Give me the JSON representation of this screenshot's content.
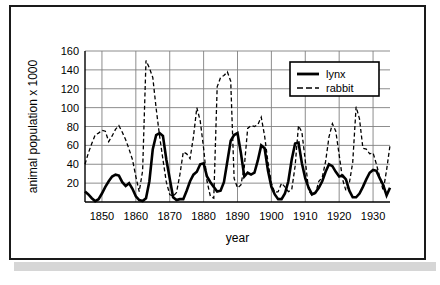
{
  "figure": {
    "border_color": "#1a1a1a",
    "shadow_color": "#d6d6d6",
    "background": "#ffffff"
  },
  "chart_data": {
    "type": "line",
    "title": "",
    "subtitle": "",
    "xlabel": "year",
    "ylabel": "animal population x 1000",
    "xlim": [
      1845,
      1935
    ],
    "ylim": [
      0,
      160
    ],
    "xticks": [
      1850,
      1860,
      1870,
      1880,
      1890,
      1900,
      1910,
      1920,
      1930
    ],
    "yticks": [
      20,
      40,
      60,
      80,
      100,
      120,
      140,
      160
    ],
    "xtick_labels": [
      "1850",
      "1860",
      "1870",
      "1880",
      "1890",
      "1900",
      "1910",
      "1920",
      "1930"
    ],
    "ytick_labels": [
      "20",
      "40",
      "60",
      "80",
      "100",
      "120",
      "140",
      "160"
    ],
    "grid": true,
    "grid_color": "#808080",
    "legend_position": "upper right",
    "legend_entries": [
      "lynx",
      "rabbit"
    ],
    "x": [
      1845,
      1846,
      1847,
      1848,
      1849,
      1850,
      1851,
      1852,
      1853,
      1854,
      1855,
      1856,
      1857,
      1858,
      1859,
      1860,
      1861,
      1862,
      1863,
      1864,
      1865,
      1866,
      1867,
      1868,
      1869,
      1870,
      1871,
      1872,
      1873,
      1874,
      1875,
      1876,
      1877,
      1878,
      1879,
      1880,
      1881,
      1882,
      1883,
      1884,
      1885,
      1886,
      1887,
      1888,
      1889,
      1890,
      1891,
      1892,
      1893,
      1894,
      1895,
      1896,
      1897,
      1898,
      1899,
      1900,
      1901,
      1902,
      1903,
      1904,
      1905,
      1906,
      1907,
      1908,
      1909,
      1910,
      1911,
      1912,
      1913,
      1914,
      1915,
      1916,
      1917,
      1918,
      1919,
      1920,
      1921,
      1922,
      1923,
      1924,
      1925,
      1926,
      1927,
      1928,
      1929,
      1930,
      1931,
      1932,
      1933,
      1934,
      1935
    ],
    "series": [
      {
        "name": "lynx",
        "style": "solid",
        "color": "#000000",
        "line_width": 2.6,
        "values": [
          11,
          8,
          4,
          1,
          3,
          9,
          16,
          22,
          27,
          29,
          28,
          21,
          17,
          20,
          14,
          6,
          2,
          1,
          4,
          22,
          56,
          71,
          73,
          70,
          45,
          25,
          5,
          2,
          3,
          3,
          12,
          22,
          29,
          32,
          40,
          41,
          27,
          21,
          16,
          11,
          12,
          21,
          43,
          65,
          71,
          73,
          52,
          27,
          31,
          29,
          31,
          44,
          60,
          57,
          33,
          16,
          8,
          3,
          3,
          9,
          22,
          45,
          62,
          63,
          41,
          25,
          15,
          8,
          10,
          15,
          22,
          32,
          40,
          38,
          32,
          27,
          28,
          24,
          12,
          5,
          5,
          9,
          16,
          24,
          31,
          34,
          33,
          25,
          18,
          7,
          15
        ]
      },
      {
        "name": "rabbit",
        "style": "dashed",
        "color": "#000000",
        "line_width": 1.3,
        "values": [
          40,
          52,
          62,
          71,
          73,
          76,
          75,
          64,
          70,
          77,
          81,
          74,
          66,
          56,
          45,
          27,
          11,
          33,
          150,
          142,
          132,
          99,
          70,
          45,
          21,
          8,
          6,
          10,
          29,
          53,
          51,
          46,
          69,
          100,
          86,
          57,
          22,
          6,
          4,
          122,
          132,
          134,
          138,
          128,
          25,
          15,
          18,
          37,
          78,
          81,
          80,
          82,
          90,
          70,
          42,
          20,
          10,
          11,
          20,
          16,
          11,
          13,
          38,
          81,
          74,
          44,
          12,
          7,
          9,
          22,
          26,
          43,
          69,
          83,
          75,
          50,
          24,
          12,
          20,
          42,
          101,
          88,
          57,
          56,
          51,
          52,
          40,
          26,
          12,
          34,
          60
        ]
      }
    ]
  },
  "legend": {
    "items": [
      {
        "label": "lynx",
        "style": "solid"
      },
      {
        "label": "rabbit",
        "style": "dashed"
      }
    ]
  }
}
